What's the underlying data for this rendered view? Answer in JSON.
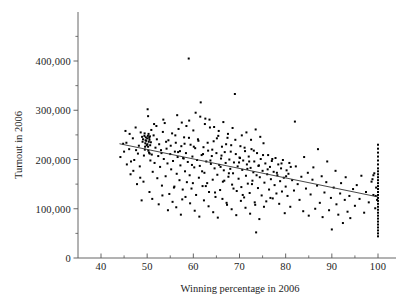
{
  "chart_data": {
    "type": "scatter",
    "title": "",
    "xlabel": "Winning percentage in 2006",
    "ylabel": "Turnout in 2006",
    "xlim": [
      35,
      103
    ],
    "ylim": [
      0,
      460000
    ],
    "grid": false,
    "legend": "none",
    "x_ticks": [
      40,
      50,
      60,
      70,
      80,
      90,
      100
    ],
    "x_tick_labels": [
      "40",
      "50",
      "60",
      "70",
      "80",
      "90",
      "100"
    ],
    "x_minor_ticks": [
      45,
      55,
      65,
      75,
      85,
      95
    ],
    "y_ticks": [
      0,
      100000,
      200000,
      300000,
      400000
    ],
    "y_tick_labels": [
      "0",
      "100,000",
      "200,000",
      "300,000",
      "400,000"
    ],
    "y_minor_ticks": [
      50000,
      150000,
      250000,
      350000,
      450000
    ],
    "marker": "dot",
    "marker_color": "#000000",
    "marker_size": 1.5,
    "trendline": {
      "type": "linear",
      "color": "#333333",
      "x_start": 44,
      "y_start": 232000,
      "x_end": 100,
      "y_end": 124000,
      "slope": -1928.6,
      "intercept": 316857
    },
    "n_points": 402,
    "points": [
      [
        44.2,
        205000
      ],
      [
        44.8,
        232000
      ],
      [
        45.3,
        258000
      ],
      [
        45.6,
        190000
      ],
      [
        46.1,
        221000
      ],
      [
        46.4,
        170000
      ],
      [
        46.9,
        243000
      ],
      [
        47.2,
        199000
      ],
      [
        47.5,
        265000
      ],
      [
        47.8,
        150000
      ],
      [
        48.0,
        212000
      ],
      [
        48.2,
        228000
      ],
      [
        48.4,
        186000
      ],
      [
        48.6,
        255000
      ],
      [
        48.8,
        117000
      ],
      [
        49.0,
        236000
      ],
      [
        49.1,
        241000
      ],
      [
        49.3,
        208000
      ],
      [
        49.4,
        248000
      ],
      [
        49.5,
        220000
      ],
      [
        49.6,
        233000
      ],
      [
        49.7,
        245000
      ],
      [
        49.8,
        238000
      ],
      [
        49.9,
        229000
      ],
      [
        50.0,
        243000
      ],
      [
        50.1,
        302000
      ],
      [
        50.2,
        226000
      ],
      [
        50.3,
        252000
      ],
      [
        50.4,
        214000
      ],
      [
        50.5,
        240000
      ],
      [
        50.6,
        247000
      ],
      [
        50.7,
        198000
      ],
      [
        50.8,
        235000
      ],
      [
        50.9,
        260000
      ],
      [
        51.0,
        210000
      ],
      [
        51.2,
        175000
      ],
      [
        51.4,
        249000
      ],
      [
        51.6,
        193000
      ],
      [
        51.8,
        224000
      ],
      [
        52.0,
        268000
      ],
      [
        52.2,
        162000
      ],
      [
        52.4,
        207000
      ],
      [
        52.6,
        231000
      ],
      [
        52.8,
        185000
      ],
      [
        53.0,
        219000
      ],
      [
        53.2,
        147000
      ],
      [
        53.4,
        256000
      ],
      [
        53.6,
        201000
      ],
      [
        53.8,
        274000
      ],
      [
        54.0,
        166000
      ],
      [
        54.2,
        222000
      ],
      [
        54.4,
        192000
      ],
      [
        54.6,
        239000
      ],
      [
        54.8,
        130000
      ],
      [
        55.0,
        211000
      ],
      [
        55.2,
        180000
      ],
      [
        55.4,
        253000
      ],
      [
        55.6,
        197000
      ],
      [
        55.8,
        143000
      ],
      [
        56.0,
        216000
      ],
      [
        56.2,
        234000
      ],
      [
        56.4,
        171000
      ],
      [
        56.6,
        205000
      ],
      [
        56.8,
        262000
      ],
      [
        57.0,
        158000
      ],
      [
        57.2,
        188000
      ],
      [
        57.4,
        227000
      ],
      [
        57.6,
        119000
      ],
      [
        57.8,
        203000
      ],
      [
        58.0,
        245000
      ],
      [
        58.2,
        176000
      ],
      [
        58.4,
        213000
      ],
      [
        58.6,
        154000
      ],
      [
        58.8,
        195000
      ],
      [
        59.0,
        405000
      ],
      [
        59.1,
        279000
      ],
      [
        59.2,
        168000
      ],
      [
        59.4,
        230000
      ],
      [
        59.6,
        141000
      ],
      [
        59.8,
        206000
      ],
      [
        60.0,
        259000
      ],
      [
        60.2,
        184000
      ],
      [
        60.4,
        223000
      ],
      [
        60.6,
        128000
      ],
      [
        60.8,
        199000
      ],
      [
        61.0,
        241000
      ],
      [
        61.2,
        163000
      ],
      [
        61.4,
        187000
      ],
      [
        61.6,
        316000
      ],
      [
        61.8,
        209000
      ],
      [
        62.0,
        146000
      ],
      [
        62.2,
        225000
      ],
      [
        62.4,
        173000
      ],
      [
        62.6,
        283000
      ],
      [
        62.8,
        196000
      ],
      [
        63.0,
        152000
      ],
      [
        63.2,
        218000
      ],
      [
        63.4,
        134000
      ],
      [
        63.6,
        265000
      ],
      [
        63.8,
        191000
      ],
      [
        64.0,
        207000
      ],
      [
        64.2,
        159000
      ],
      [
        64.4,
        237000
      ],
      [
        64.6,
        182000
      ],
      [
        64.8,
        124000
      ],
      [
        65.0,
        213000
      ],
      [
        65.2,
        169000
      ],
      [
        65.4,
        248000
      ],
      [
        65.6,
        189000
      ],
      [
        65.8,
        138000
      ],
      [
        66.0,
        202000
      ],
      [
        66.2,
        226000
      ],
      [
        66.4,
        155000
      ],
      [
        66.6,
        178000
      ],
      [
        66.8,
        215000
      ],
      [
        67.0,
        193000
      ],
      [
        67.2,
        112000
      ],
      [
        67.4,
        244000
      ],
      [
        67.6,
        165000
      ],
      [
        67.8,
        200000
      ],
      [
        68.0,
        181000
      ],
      [
        68.2,
        229000
      ],
      [
        68.4,
        149000
      ],
      [
        68.6,
        172000
      ],
      [
        68.8,
        194000
      ],
      [
        69.0,
        333000
      ],
      [
        69.2,
        211000
      ],
      [
        69.4,
        136000
      ],
      [
        69.6,
        186000
      ],
      [
        69.8,
        161000
      ],
      [
        70.0,
        204000
      ],
      [
        70.2,
        227000
      ],
      [
        70.4,
        144000
      ],
      [
        70.6,
        179000
      ],
      [
        70.8,
        198000
      ],
      [
        71.0,
        123000
      ],
      [
        71.2,
        217000
      ],
      [
        71.4,
        167000
      ],
      [
        71.6,
        190000
      ],
      [
        71.8,
        151000
      ],
      [
        72.0,
        206000
      ],
      [
        72.2,
        132000
      ],
      [
        72.4,
        183000
      ],
      [
        72.6,
        221000
      ],
      [
        72.8,
        157000
      ],
      [
        73.0,
        174000
      ],
      [
        73.2,
        196000
      ],
      [
        73.4,
        108000
      ],
      [
        73.6,
        52000
      ],
      [
        73.8,
        213000
      ],
      [
        74.0,
        142000
      ],
      [
        74.2,
        188000
      ],
      [
        74.4,
        164000
      ],
      [
        74.6,
        201000
      ],
      [
        74.8,
        127000
      ],
      [
        75.0,
        177000
      ],
      [
        75.2,
        233000
      ],
      [
        75.4,
        153000
      ],
      [
        75.6,
        192000
      ],
      [
        75.8,
        115000
      ],
      [
        76.0,
        170000
      ],
      [
        76.2,
        209000
      ],
      [
        76.4,
        139000
      ],
      [
        76.6,
        185000
      ],
      [
        76.8,
        160000
      ],
      [
        77.0,
        197000
      ],
      [
        77.2,
        121000
      ],
      [
        77.4,
        175000
      ],
      [
        77.6,
        148000
      ],
      [
        77.8,
        203000
      ],
      [
        78.0,
        131000
      ],
      [
        78.2,
        168000
      ],
      [
        78.4,
        190000
      ],
      [
        78.6,
        110000
      ],
      [
        78.8,
        156000
      ],
      [
        79.0,
        182000
      ],
      [
        79.2,
        135000
      ],
      [
        79.4,
        199000
      ],
      [
        79.6,
        163000
      ],
      [
        79.8,
        91000
      ],
      [
        80.0,
        145000
      ],
      [
        80.2,
        178000
      ],
      [
        80.4,
        126000
      ],
      [
        80.6,
        171000
      ],
      [
        80.8,
        193000
      ],
      [
        81.0,
        104000
      ],
      [
        81.4,
        158000
      ],
      [
        81.8,
        137000
      ],
      [
        82.0,
        277000
      ],
      [
        82.2,
        186000
      ],
      [
        82.6,
        150000
      ],
      [
        83.0,
        118000
      ],
      [
        83.4,
        165000
      ],
      [
        83.8,
        95000
      ],
      [
        84.0,
        205000
      ],
      [
        84.4,
        141000
      ],
      [
        84.8,
        173000
      ],
      [
        85.0,
        86000
      ],
      [
        85.4,
        129000
      ],
      [
        85.8,
        159000
      ],
      [
        86.0,
        184000
      ],
      [
        86.4,
        100000
      ],
      [
        86.8,
        147000
      ],
      [
        87.0,
        221000
      ],
      [
        87.4,
        112000
      ],
      [
        87.8,
        166000
      ],
      [
        88.0,
        83000
      ],
      [
        88.4,
        133000
      ],
      [
        88.8,
        154000
      ],
      [
        89.0,
        196000
      ],
      [
        89.4,
        97000
      ],
      [
        89.8,
        122000
      ],
      [
        90.0,
        58000
      ],
      [
        90.4,
        143000
      ],
      [
        90.8,
        177000
      ],
      [
        91.0,
        109000
      ],
      [
        91.4,
        88000
      ],
      [
        91.8,
        131000
      ],
      [
        92.0,
        152000
      ],
      [
        92.4,
        71000
      ],
      [
        92.8,
        118000
      ],
      [
        93.0,
        164000
      ],
      [
        93.4,
        94000
      ],
      [
        93.8,
        126000
      ],
      [
        94.0,
        81000
      ],
      [
        94.6,
        140000
      ],
      [
        95.0,
        106000
      ],
      [
        95.4,
        148000
      ],
      [
        96.0,
        120000
      ],
      [
        96.4,
        167000
      ],
      [
        97.0,
        92000
      ],
      [
        97.4,
        134000
      ],
      [
        98.0,
        113000
      ],
      [
        98.6,
        155000
      ],
      [
        99.0,
        128000
      ],
      [
        99.4,
        101000
      ],
      [
        99.6,
        143000
      ],
      [
        99.8,
        118000
      ],
      [
        100.0,
        230000
      ],
      [
        100.0,
        222000
      ],
      [
        100.0,
        214000
      ],
      [
        100.0,
        206000
      ],
      [
        100.0,
        198000
      ],
      [
        100.0,
        190000
      ],
      [
        100.0,
        182000
      ],
      [
        100.0,
        176000
      ],
      [
        100.0,
        170000
      ],
      [
        100.0,
        164000
      ],
      [
        100.0,
        158000
      ],
      [
        100.0,
        152000
      ],
      [
        100.0,
        146000
      ],
      [
        100.0,
        140000
      ],
      [
        100.0,
        134000
      ],
      [
        100.0,
        128000
      ],
      [
        100.0,
        122000
      ],
      [
        100.0,
        116000
      ],
      [
        100.0,
        110000
      ],
      [
        100.0,
        104000
      ],
      [
        100.0,
        98000
      ],
      [
        100.0,
        92000
      ],
      [
        100.0,
        86000
      ],
      [
        100.0,
        80000
      ],
      [
        100.0,
        74000
      ],
      [
        100.0,
        68000
      ],
      [
        100.0,
        62000
      ],
      [
        100.0,
        56000
      ],
      [
        100.0,
        50000
      ],
      [
        100.0,
        44000
      ],
      [
        99.2,
        172000
      ],
      [
        99.0,
        168000
      ],
      [
        98.8,
        160000
      ],
      [
        99.5,
        126000
      ],
      [
        50.2,
        288000
      ],
      [
        51.5,
        272000
      ],
      [
        53.5,
        281000
      ],
      [
        56.5,
        290000
      ],
      [
        57.5,
        275000
      ],
      [
        58.5,
        268000
      ],
      [
        60.5,
        295000
      ],
      [
        61.5,
        287000
      ],
      [
        62.5,
        272000
      ],
      [
        63.5,
        281000
      ],
      [
        64.5,
        266000
      ],
      [
        65.5,
        258000
      ],
      [
        66.5,
        276000
      ],
      [
        67.5,
        252000
      ],
      [
        68.5,
        264000
      ],
      [
        70.5,
        249000
      ],
      [
        71.5,
        255000
      ],
      [
        72.5,
        240000
      ],
      [
        73.5,
        261000
      ],
      [
        74.5,
        246000
      ],
      [
        46.5,
        196000
      ],
      [
        47.0,
        177000
      ],
      [
        48.5,
        163000
      ],
      [
        49.2,
        155000
      ],
      [
        50.5,
        134000
      ],
      [
        51.1,
        120000
      ],
      [
        52.5,
        109000
      ],
      [
        53.3,
        127000
      ],
      [
        54.5,
        97000
      ],
      [
        55.5,
        114000
      ],
      [
        56.3,
        103000
      ],
      [
        57.3,
        88000
      ],
      [
        58.3,
        124000
      ],
      [
        59.3,
        111000
      ],
      [
        60.3,
        96000
      ],
      [
        61.3,
        84000
      ],
      [
        62.3,
        117000
      ],
      [
        63.3,
        105000
      ],
      [
        64.3,
        93000
      ],
      [
        65.3,
        82000
      ],
      [
        66.3,
        120000
      ],
      [
        67.3,
        108000
      ],
      [
        68.3,
        99000
      ],
      [
        69.3,
        87000
      ],
      [
        70.3,
        116000
      ],
      [
        71.3,
        102000
      ],
      [
        72.3,
        90000
      ],
      [
        73.3,
        113000
      ],
      [
        74.3,
        79000
      ],
      [
        75.3,
        104000
      ],
      [
        45.0,
        216000
      ],
      [
        45.5,
        234000
      ],
      [
        46.2,
        252000
      ],
      [
        47.6,
        219000
      ],
      [
        48.9,
        246000
      ],
      [
        49.45,
        253000
      ],
      [
        49.55,
        226000
      ],
      [
        49.65,
        239000
      ],
      [
        50.05,
        231000
      ],
      [
        50.15,
        248000
      ],
      [
        50.25,
        218000
      ],
      [
        50.35,
        236000
      ],
      [
        50.45,
        244000
      ],
      [
        50.55,
        212000
      ],
      [
        50.65,
        229000
      ],
      [
        52.1,
        241000
      ],
      [
        53.1,
        213000
      ],
      [
        54.1,
        236000
      ],
      [
        55.1,
        228000
      ],
      [
        56.1,
        249000
      ],
      [
        57.1,
        217000
      ],
      [
        58.1,
        232000
      ],
      [
        59.05,
        244000
      ],
      [
        60.1,
        226000
      ],
      [
        61.1,
        238000
      ],
      [
        62.1,
        211000
      ],
      [
        63.1,
        234000
      ],
      [
        64.1,
        220000
      ],
      [
        65.1,
        243000
      ],
      [
        66.1,
        208000
      ],
      [
        67.1,
        231000
      ],
      [
        68.1,
        216000
      ],
      [
        69.1,
        240000
      ],
      [
        70.1,
        203000
      ],
      [
        71.1,
        224000
      ],
      [
        72.1,
        196000
      ],
      [
        73.1,
        218000
      ],
      [
        74.1,
        187000
      ],
      [
        75.1,
        209000
      ],
      [
        76.1,
        180000
      ],
      [
        77.1,
        201000
      ],
      [
        78.1,
        173000
      ],
      [
        79.1,
        192000
      ],
      [
        80.1,
        166000
      ],
      [
        81.1,
        185000
      ],
      [
        56.7,
        215000
      ],
      [
        57.9,
        202000
      ],
      [
        59.7,
        189000
      ],
      [
        61.9,
        176000
      ],
      [
        63.7,
        198000
      ],
      [
        65.9,
        185000
      ],
      [
        67.7,
        172000
      ],
      [
        69.9,
        194000
      ],
      [
        71.7,
        181000
      ],
      [
        73.7,
        168000
      ],
      [
        55.9,
        145000
      ],
      [
        57.7,
        139000
      ],
      [
        59.9,
        152000
      ],
      [
        62.7,
        146000
      ],
      [
        64.7,
        133000
      ],
      [
        66.7,
        157000
      ],
      [
        68.7,
        141000
      ],
      [
        70.7,
        128000
      ],
      [
        72.7,
        150000
      ],
      [
        76.7,
        122000
      ]
    ]
  },
  "axes": {
    "x_axis_name": "x-axis",
    "y_axis_name": "y-axis"
  }
}
